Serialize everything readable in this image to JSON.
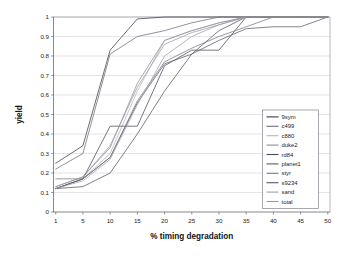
{
  "chart_data": {
    "type": "line",
    "title": "",
    "xlabel": "% timing degradation",
    "ylabel": "yield",
    "categories": [
      1,
      5,
      10,
      15,
      20,
      25,
      30,
      35,
      40,
      45,
      50
    ],
    "xtick_labels": [
      "1",
      "5",
      "10",
      "15",
      "20",
      "25",
      "30",
      "35",
      "40",
      "45",
      "50"
    ],
    "ytick_labels": [
      "0",
      "0.1",
      "0.2",
      "0.3",
      "0.4",
      "0.5",
      "0.6",
      "0.7",
      "0.8",
      "0.9",
      "1"
    ],
    "ylim": [
      0,
      1
    ],
    "ystep": 0.1,
    "grid": "horizontal",
    "legend_position": "right-inside",
    "series": [
      {
        "name": "9sym",
        "color": "#3c3c46",
        "values": [
          0.25,
          0.34,
          0.83,
          0.99,
          1.0,
          1.0,
          1.0,
          1.0,
          1.0,
          1.0,
          1.0
        ]
      },
      {
        "name": "c499",
        "color": "#6e6e7a",
        "values": [
          0.22,
          0.3,
          0.81,
          0.9,
          0.93,
          0.97,
          1.0,
          1.0,
          1.0,
          1.0,
          1.0
        ]
      },
      {
        "name": "c880",
        "color": "#b4b4be",
        "values": [
          0.12,
          0.17,
          0.3,
          0.62,
          0.88,
          0.93,
          0.97,
          1.0,
          1.0,
          1.0,
          1.0
        ]
      },
      {
        "name": "duke2",
        "color": "#8c8c96",
        "values": [
          0.13,
          0.18,
          0.33,
          0.66,
          0.88,
          0.93,
          0.97,
          1.0,
          1.0,
          1.0,
          1.0
        ]
      },
      {
        "name": "rd84",
        "color": "#4a4a55",
        "values": [
          0.12,
          0.17,
          0.44,
          0.44,
          0.75,
          0.83,
          0.83,
          1.0,
          1.0,
          1.0,
          1.0
        ]
      },
      {
        "name": "planet1",
        "color": "#5a5a66",
        "values": [
          0.12,
          0.17,
          0.28,
          0.56,
          0.76,
          0.81,
          0.88,
          0.94,
          0.95,
          0.95,
          1.0
        ]
      },
      {
        "name": "styr",
        "color": "#787884",
        "values": [
          0.17,
          0.17,
          0.28,
          0.57,
          0.77,
          0.84,
          0.9,
          0.95,
          1.0,
          1.0,
          1.0
        ]
      },
      {
        "name": "s9234",
        "color": "#55555f",
        "values": [
          0.12,
          0.13,
          0.2,
          0.4,
          0.62,
          0.81,
          0.93,
          1.0,
          1.0,
          1.0,
          1.0
        ]
      },
      {
        "name": "sand",
        "color": "#a0a0aa",
        "values": [
          0.12,
          0.16,
          0.27,
          0.55,
          0.8,
          0.9,
          0.96,
          1.0,
          1.0,
          1.0,
          1.0
        ]
      },
      {
        "name": "total",
        "color": "#9a9aa4",
        "values": [
          0.13,
          0.18,
          0.34,
          0.64,
          0.86,
          0.92,
          0.96,
          1.0,
          1.0,
          1.0,
          1.0
        ]
      }
    ]
  },
  "legend": {
    "entries": [
      {
        "label": "9sym"
      },
      {
        "label": "c499"
      },
      {
        "label": "c880"
      },
      {
        "label": "duke2"
      },
      {
        "label": "rd84"
      },
      {
        "label": "planet1"
      },
      {
        "label": "styr"
      },
      {
        "label": "s9234"
      },
      {
        "label": "sand"
      },
      {
        "label": "total"
      }
    ]
  }
}
